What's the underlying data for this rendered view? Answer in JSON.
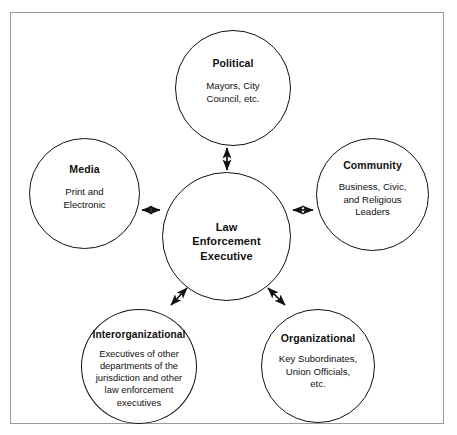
{
  "diagram": {
    "type": "hub-and-spoke",
    "center": {
      "id": "center",
      "title": "Law\nEnforcement\nExecutive",
      "body": ""
    },
    "nodes": [
      {
        "id": "political",
        "title": "Political",
        "body": "Mayors, City\nCouncil, etc."
      },
      {
        "id": "media",
        "title": "Media",
        "body": "Print and\nElectronic"
      },
      {
        "id": "community",
        "title": "Community",
        "body": "Business, Civic,\nand Religious\nLeaders"
      },
      {
        "id": "interorganizational",
        "title": "Interorganizational",
        "body": "Executives of other\ndepartments of the\njurisdiction and other\nlaw enforcement\nexecutives"
      },
      {
        "id": "organizational",
        "title": "Organizational",
        "body": "Key Subordinates,\nUnion Officials,\netc."
      }
    ],
    "connectors": [
      {
        "from": "center",
        "to": "political",
        "style": "double-arrow"
      },
      {
        "from": "center",
        "to": "media",
        "style": "double-arrow"
      },
      {
        "from": "center",
        "to": "community",
        "style": "double-arrow"
      },
      {
        "from": "center",
        "to": "interorganizational",
        "style": "double-arrow"
      },
      {
        "from": "center",
        "to": "organizational",
        "style": "double-arrow"
      }
    ],
    "colors": {
      "stroke": "#111111",
      "frame": "#9a9a9a",
      "background": "#ffffff",
      "text": "#101010"
    }
  }
}
